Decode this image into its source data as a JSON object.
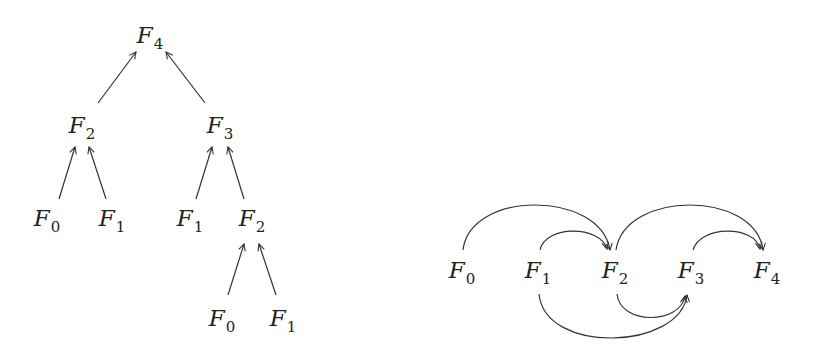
{
  "tree": {
    "title": "Recursion tree",
    "nodes": [
      {
        "id": "t0",
        "base": "F",
        "sub": "4",
        "x": 150,
        "y": 35
      },
      {
        "id": "t1",
        "base": "F",
        "sub": "2",
        "x": 82,
        "y": 125
      },
      {
        "id": "t2",
        "base": "F",
        "sub": "3",
        "x": 220,
        "y": 125
      },
      {
        "id": "t3",
        "base": "F",
        "sub": "0",
        "x": 47,
        "y": 218
      },
      {
        "id": "t4",
        "base": "F",
        "sub": "1",
        "x": 112,
        "y": 218
      },
      {
        "id": "t5",
        "base": "F",
        "sub": "1",
        "x": 190,
        "y": 218
      },
      {
        "id": "t6",
        "base": "F",
        "sub": "2",
        "x": 252,
        "y": 218
      },
      {
        "id": "t7",
        "base": "F",
        "sub": "0",
        "x": 222,
        "y": 318
      },
      {
        "id": "t8",
        "base": "F",
        "sub": "1",
        "x": 283,
        "y": 318
      }
    ],
    "edges": [
      {
        "from": "F2",
        "to": "F4"
      },
      {
        "from": "F3",
        "to": "F4"
      },
      {
        "from": "F0",
        "to": "F2"
      },
      {
        "from": "F1",
        "to": "F2"
      },
      {
        "from": "F1",
        "to": "F3"
      },
      {
        "from": "F2",
        "to": "F3"
      },
      {
        "from": "F0",
        "to": "F2"
      },
      {
        "from": "F1",
        "to": "F2"
      }
    ]
  },
  "dag": {
    "title": "Dependency DAG",
    "nodes": [
      {
        "id": "d0",
        "base": "F",
        "sub": "0",
        "x": 462,
        "y": 270
      },
      {
        "id": "d1",
        "base": "F",
        "sub": "1",
        "x": 538,
        "y": 270
      },
      {
        "id": "d2",
        "base": "F",
        "sub": "2",
        "x": 615,
        "y": 270
      },
      {
        "id": "d3",
        "base": "F",
        "sub": "3",
        "x": 691,
        "y": 270
      },
      {
        "id": "d4",
        "base": "F",
        "sub": "4",
        "x": 767,
        "y": 270
      }
    ],
    "edges": [
      {
        "from": "F0",
        "to": "F2",
        "side": "above"
      },
      {
        "from": "F1",
        "to": "F2",
        "side": "above"
      },
      {
        "from": "F2",
        "to": "F4",
        "side": "above"
      },
      {
        "from": "F3",
        "to": "F4",
        "side": "above"
      },
      {
        "from": "F1",
        "to": "F3",
        "side": "below"
      },
      {
        "from": "F2",
        "to": "F3",
        "side": "below"
      }
    ]
  }
}
